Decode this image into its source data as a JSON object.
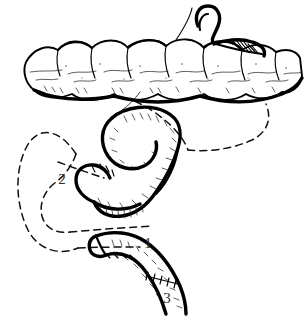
{
  "figure": {
    "background_color": "#ffffff",
    "ink_color": "#000000",
    "label_color": "#2d2d2d",
    "dashed_line_color": "#111111"
  },
  "labels": [
    {
      "id": "label-1",
      "text": "1",
      "x": 148,
      "y": 248,
      "meaning": "efferent-limb"
    },
    {
      "id": "label-2",
      "text": "2",
      "x": 62,
      "y": 184,
      "meaning": "afferent-limb-stump"
    },
    {
      "id": "label-3",
      "text": "3",
      "x": 167,
      "y": 303,
      "meaning": "distal-segment-below-anastomosis"
    }
  ],
  "structures": [
    {
      "name": "transverse-colon",
      "description": "Horizontal haustrated bowel band across the upper third of the figure",
      "style": "solid-outline-with-texture"
    },
    {
      "name": "colon-tenia-texture",
      "description": "Stippled and short-stroke shading inside the colon band",
      "style": "stipple"
    },
    {
      "name": "upper-right-loop-end",
      "description": "Dark hook-shaped bowel end entering the colon at the upper right",
      "style": "heavy-solid"
    },
    {
      "name": "upper-right-hatching",
      "description": "Parallel hatch shading where the hook meets the colon",
      "style": "hatch"
    },
    {
      "name": "central-s-loop",
      "description": "Large S-shaped / C-shaped bowel loop in the middle of the figure",
      "style": "solid-outline-with-texture"
    },
    {
      "name": "central-loop-stump",
      "description": "Blind-ending bowel stump at the left of the central loop",
      "style": "heavy-solid"
    },
    {
      "name": "lower-limb",
      "description": "Descending bowel limb in the lower right carrying labels 1 and 3",
      "style": "solid-outline-with-texture"
    },
    {
      "name": "lower-limb-stump",
      "description": "Closed proximal end of the lower limb at the left",
      "style": "heavy-solid"
    },
    {
      "name": "suture-line",
      "description": "Row of short cross stitches marking the anastomosis on the lower limb",
      "style": "stitch-marks"
    },
    {
      "name": "mesenteric-thread",
      "description": "Thin line running from the colon down to the top of the central loop",
      "style": "hairline"
    },
    {
      "name": "dashed-former-position-left",
      "description": "Dashed outline of the bowel loop in its original position at the left",
      "style": "dashed"
    },
    {
      "name": "dashed-former-position-right",
      "description": "Dashed arc sweeping from the colon to the right side of the central loop",
      "style": "dashed"
    }
  ]
}
